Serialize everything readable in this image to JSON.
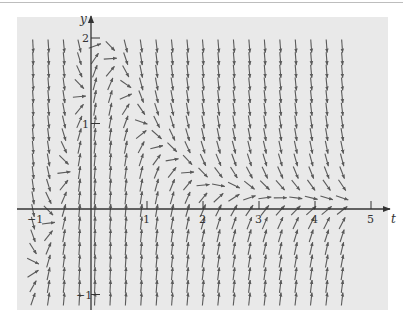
{
  "figure": {
    "kind": "direction field (slope field)",
    "background_color": "#e9e9e9",
    "arrow_color": "#5a5a5a",
    "axis_color": "#333333",
    "plot_region": {
      "x": 17,
      "y": 17,
      "width": 371,
      "height": 293
    },
    "origin_px": {
      "x": 91,
      "y": 209
    },
    "px_per_unit": {
      "t": 56,
      "y": 85.5
    },
    "axes": {
      "x_label": "t",
      "y_label": "y",
      "x_ticks": [
        {
          "value": -1,
          "label": "−1"
        },
        {
          "value": 1,
          "label": "1"
        },
        {
          "value": 2,
          "label": "2"
        },
        {
          "value": 3,
          "label": "3"
        },
        {
          "value": 4,
          "label": "4"
        },
        {
          "value": 5,
          "label": "5"
        }
      ],
      "y_ticks": [
        {
          "value": -1,
          "label": "−1"
        },
        {
          "value": 1,
          "label": "1"
        },
        {
          "value": 2,
          "label": "2"
        }
      ]
    },
    "grid": {
      "t_start": -1.0,
      "t_step": 0.3,
      "t_count": 21,
      "y_start": -1.05,
      "y_step": 0.148,
      "y_count": 21,
      "arrow_length_px": 13
    },
    "zero_slope_curve_samples": [
      {
        "t": -1.0,
        "y": -0.65
      },
      {
        "t": -0.5,
        "y": 0.3
      },
      {
        "t": 0.0,
        "y": 1.9
      },
      {
        "t": 0.2,
        "y": 2.05
      },
      {
        "t": 1.0,
        "y": 0.9
      },
      {
        "t": 2.0,
        "y": 0.32
      },
      {
        "t": 3.0,
        "y": 0.18
      },
      {
        "t": 4.0,
        "y": 0.12
      },
      {
        "t": 5.0,
        "y": 0.1
      }
    ]
  }
}
